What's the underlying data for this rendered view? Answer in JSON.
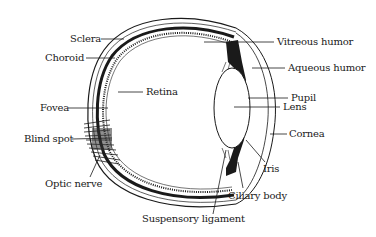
{
  "diagram": {
    "labels": {
      "sclera": "Sclera",
      "choroid": "Choroid",
      "retina": "Retina",
      "fovea": "Fovea",
      "blind_spot": "Blind spot",
      "optic_nerve": "Optic nerve",
      "suspensory_ligament": "Suspensory ligament",
      "ciliary_body": "Ciliary body",
      "iris": "Iris",
      "cornea": "Cornea",
      "lens": "Lens",
      "pupil": "Pupil",
      "aqueous_humor": "Aqueous humor",
      "vitreous_humor": "Vitreous humor"
    },
    "colors": {
      "ink": "#1a1a1a",
      "background": "#ffffff"
    }
  }
}
